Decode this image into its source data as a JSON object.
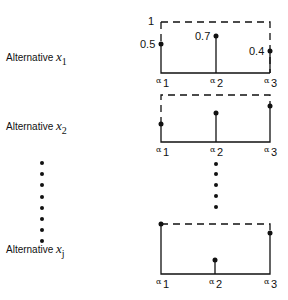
{
  "alternatives": [
    {
      "name": "Alternative",
      "var": "x",
      "sub": "1",
      "values": [
        0.5,
        0.7,
        0.4
      ],
      "labeled": true
    },
    {
      "name": "Alternative",
      "var": "x",
      "sub": "2",
      "values": [
        0.6,
        0.65,
        0.85
      ],
      "labeled": false
    },
    {
      "name": "Alternative",
      "var": "x",
      "sub": "j",
      "values": [
        1.0,
        0.35,
        0.85
      ],
      "labeled": false
    }
  ],
  "axis": {
    "max_label": "1",
    "points": [
      {
        "sym": "α",
        "sub": "1"
      },
      {
        "sym": "α",
        "sub": "2"
      },
      {
        "sym": "α",
        "sub": "3"
      }
    ]
  },
  "value_labels": {
    "a1": "0.5",
    "a2": "0.7",
    "a3": "0.4"
  }
}
